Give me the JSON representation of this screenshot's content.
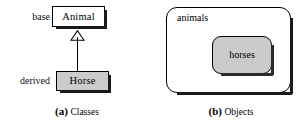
{
  "figure": {
    "panel_a": {
      "caption_tag": "(a)",
      "caption_text": "Classes",
      "base_label": "base",
      "derived_label": "derived",
      "base_class": "Animal",
      "derived_class": "Horse",
      "relationship": "inheritance-generalization",
      "colors": {
        "base_fill": "#ffffff",
        "derived_fill": "#cbcbcb",
        "stroke": "#000000",
        "shadow": "#1a1a1a"
      }
    },
    "panel_b": {
      "caption_tag": "(b)",
      "caption_text": "Objects",
      "outer_set_label": "animals",
      "inner_set_label": "horses",
      "colors": {
        "outer_fill": "#ffffff",
        "inner_fill": "#cbcbcb",
        "stroke": "#000000",
        "shadow": "#2b2b2b"
      }
    }
  }
}
